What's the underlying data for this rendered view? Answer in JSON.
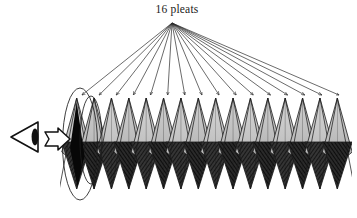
{
  "figure": {
    "title": "16 pleats",
    "caption_position": {
      "x": 177,
      "y": 13
    },
    "background_color": "#ffffff",
    "width": 357,
    "height": 218
  },
  "annotation": {
    "label": "16 pleats",
    "pleat_count": 16,
    "fan": {
      "apex": {
        "x": 172,
        "y": 23
      },
      "arrow_tip_y": 95,
      "arrow_count": 16,
      "first_tip_x": 82,
      "last_tip_x": 339,
      "line_color": "#2b2b2b",
      "line_width": 0.7,
      "arrowhead_length": 7,
      "arrowhead_width": 4.2
    }
  },
  "pleats": {
    "count": 16,
    "band": {
      "left_x": 68,
      "right_x": 346,
      "peak_y": 98,
      "mid_y": 146,
      "valley_y": 189
    },
    "light_face_color": "#c9c9c9",
    "light_face_color_dark": "#b3b3b3",
    "dark_face_color": "#2e2e2e",
    "dark_face_color_deep": "#101010",
    "edge_color": "#1c1c1c",
    "edge_width": 0.8,
    "hatch_color": "#000000",
    "first_pleat_shadow_color": "#070707"
  },
  "tube_outline": {
    "ellipses": [
      {
        "name": "outer-rim-ellipse",
        "cx": 80,
        "cy": 144,
        "rx": 17.5,
        "ry": 56
      },
      {
        "name": "inner-rim-ellipse",
        "cx": 91,
        "cy": 140,
        "rx": 11,
        "ry": 44
      }
    ],
    "stroke_color": "#1c1c1c",
    "stroke_width": 0.85
  },
  "viewer": {
    "eye_icon": {
      "name": "eye-icon",
      "apex": {
        "x": 11,
        "y": 137
      },
      "top_back": {
        "x": 38,
        "y": 122
      },
      "bottom_back": {
        "x": 38,
        "y": 152
      },
      "pupil": {
        "cx": 35,
        "cy": 137,
        "rx": 3.4,
        "ry": 8.5
      },
      "stroke_color": "#111111",
      "stroke_width": 1.6,
      "pupil_fill": "#111111"
    },
    "sight_arrow": {
      "name": "line-of-sight-arrow",
      "points": "45,132 58,132 58,128 70,139 58,150 58,146 45,146 49,139",
      "fill": "#ffffff",
      "stroke_color": "#111111",
      "stroke_width": 1.5
    }
  },
  "colors": {
    "ink": "#1a1a1a",
    "light_gray": "#c9c9c9",
    "dark_gray": "#2e2e2e",
    "paper": "#ffffff"
  },
  "chart_data": {
    "type": "diagram",
    "title": "16 pleats",
    "categories": [
      "pleat 1",
      "pleat 2",
      "pleat 3",
      "pleat 4",
      "pleat 5",
      "pleat 6",
      "pleat 7",
      "pleat 8",
      "pleat 9",
      "pleat 10",
      "pleat 11",
      "pleat 12",
      "pleat 13",
      "pleat 14",
      "pleat 15",
      "pleat 16"
    ],
    "values": [
      1,
      1,
      1,
      1,
      1,
      1,
      1,
      1,
      1,
      1,
      1,
      1,
      1,
      1,
      1,
      1
    ],
    "xlabel": "",
    "ylabel": "",
    "legend": []
  }
}
